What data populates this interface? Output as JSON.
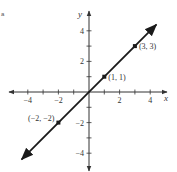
{
  "corner_mark": "a",
  "chart_data": {
    "type": "line",
    "title": "",
    "xlabel": "x",
    "ylabel": "y",
    "xlim": [
      -5,
      5
    ],
    "ylim": [
      -5,
      5
    ],
    "grid": false,
    "x_ticks": [
      -4,
      -3,
      -2,
      -1,
      1,
      2,
      3,
      4
    ],
    "y_ticks": [
      -4,
      -3,
      -2,
      -1,
      1,
      2,
      3,
      4
    ],
    "x_tick_labels": [
      "-4",
      "-2",
      "2",
      "4"
    ],
    "x_tick_label_values": [
      -4,
      -2,
      2,
      4
    ],
    "y_tick_labels": [
      "4",
      "2",
      "-2",
      "-4"
    ],
    "y_tick_label_values": [
      4,
      2,
      -2,
      -4
    ],
    "series": [
      {
        "name": "y = x",
        "equation": "y = x",
        "x": [
          -4.4,
          4.4
        ],
        "y": [
          -4.4,
          4.4
        ],
        "arrows": "both",
        "color": "#1a1a1a"
      }
    ],
    "points": [
      {
        "x": -2,
        "y": -2,
        "label": "(−2, −2)"
      },
      {
        "x": 1,
        "y": 1,
        "label": "(1, 1)"
      },
      {
        "x": 3,
        "y": 3,
        "label": "(3, 3)"
      }
    ]
  },
  "layout": {
    "origin_px": [
      89,
      92
    ],
    "unit_px": 15.3
  }
}
